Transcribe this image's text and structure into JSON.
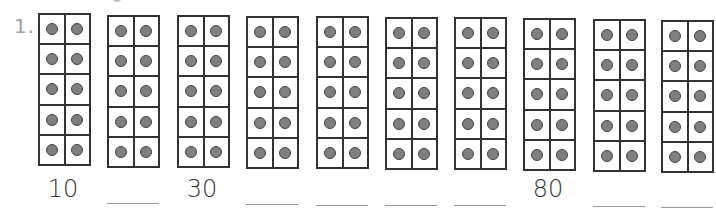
{
  "worksheet": {
    "question_number": "1.",
    "frame_rows": 5,
    "frame_cols": 2,
    "dot_color": "#7f7f7f",
    "frames": [
      {
        "dots": 10,
        "answer": "10",
        "blank": false
      },
      {
        "dots": 10,
        "answer": "",
        "blank": true
      },
      {
        "dots": 10,
        "answer": "30",
        "blank": false
      },
      {
        "dots": 10,
        "answer": "",
        "blank": true
      },
      {
        "dots": 10,
        "answer": "",
        "blank": true
      },
      {
        "dots": 10,
        "answer": "",
        "blank": true
      },
      {
        "dots": 10,
        "answer": "",
        "blank": true
      },
      {
        "dots": 10,
        "answer": "80",
        "blank": false
      },
      {
        "dots": 10,
        "answer": "",
        "blank": true
      },
      {
        "dots": 10,
        "answer": "",
        "blank": true
      }
    ]
  }
}
